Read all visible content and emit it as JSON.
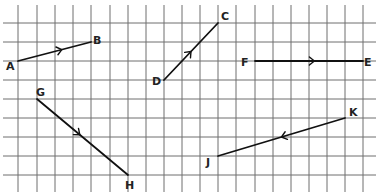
{
  "diagram": {
    "title": "",
    "grid": {
      "columns_x": [
        18,
        37,
        55,
        73,
        91,
        110,
        128,
        146,
        164,
        182,
        200,
        218,
        236,
        255,
        273,
        291,
        309,
        327,
        345,
        363
      ],
      "rows_y": [
        23,
        42,
        61,
        80,
        99,
        118,
        137,
        156,
        175
      ],
      "h_line_x_start": 3,
      "h_line_x_end": 376,
      "v_line_y_start": 5,
      "v_line_y_end": 192,
      "color": "#6e6e6e"
    },
    "vectors": [
      {
        "name": "AB",
        "from": {
          "label": "A",
          "x": 18,
          "y": 61,
          "grid": [
            0,
            2
          ],
          "label_x": 6,
          "label_y": 70
        },
        "to": {
          "label": "B",
          "x": 91,
          "y": 42,
          "grid": [
            4,
            1
          ],
          "label_x": 93,
          "label_y": 44
        },
        "arrow_at": 0.6
      },
      {
        "name": "DC",
        "from": {
          "label": "D",
          "x": 164,
          "y": 80,
          "grid": [
            8,
            3
          ],
          "label_x": 152,
          "label_y": 85
        },
        "to": {
          "label": "C",
          "x": 218,
          "y": 23,
          "grid": [
            11,
            0
          ],
          "label_x": 221,
          "label_y": 20
        },
        "arrow_at": 0.5
      },
      {
        "name": "FE",
        "from": {
          "label": "F",
          "x": 255,
          "y": 61,
          "grid": [
            13,
            2
          ],
          "label_x": 241,
          "label_y": 66
        },
        "to": {
          "label": "E",
          "x": 363,
          "y": 61,
          "grid": [
            19,
            2
          ],
          "label_x": 364,
          "label_y": 66
        },
        "arrow_at": 0.55
      },
      {
        "name": "GH",
        "from": {
          "label": "G",
          "x": 37,
          "y": 99,
          "grid": [
            1,
            4
          ],
          "label_x": 36,
          "label_y": 96
        },
        "to": {
          "label": "H",
          "x": 128,
          "y": 175,
          "grid": [
            6,
            8
          ],
          "label_x": 125,
          "label_y": 189
        },
        "arrow_at": 0.47
      },
      {
        "name": "KJ",
        "from": {
          "label": "K",
          "x": 345,
          "y": 118,
          "grid": [
            18,
            5
          ],
          "label_x": 349,
          "label_y": 116
        },
        "to": {
          "label": "J",
          "x": 218,
          "y": 156,
          "grid": [
            11,
            7
          ],
          "label_x": 206,
          "label_y": 166
        },
        "arrow_at": 0.5
      }
    ],
    "colors": {
      "line": "#111111",
      "label": "#222222",
      "background": "#ffffff"
    }
  }
}
